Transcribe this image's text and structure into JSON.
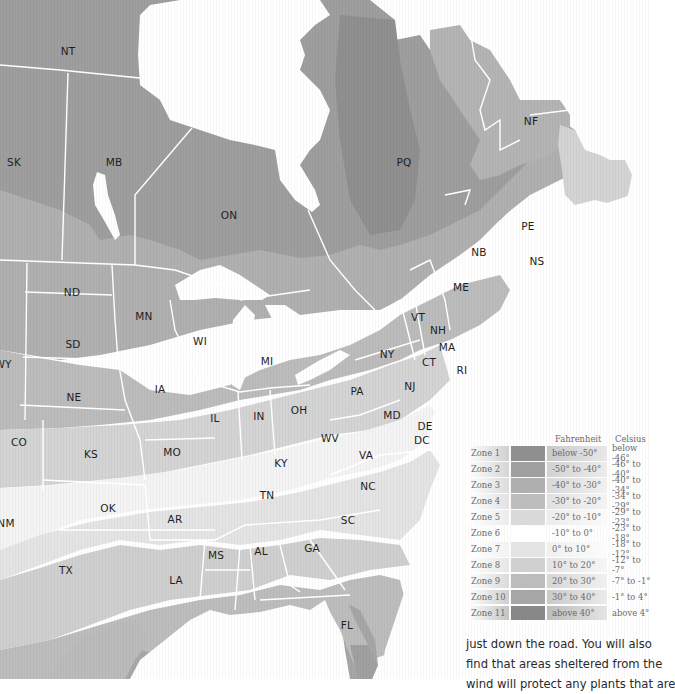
{
  "map": {
    "title": "Plant hardiness zones — North America (eastern)",
    "colors": {
      "zone1": "#8f8f8f",
      "zone2": "#a0a0a0",
      "zone3": "#afafaf",
      "zone4": "#bdbdbd",
      "zone5": "#d6d6d6",
      "zone6": "#f4f4f4",
      "zone7": "#e6e6e6",
      "zone8": "#d2d2d2",
      "zone9": "#c0c0c0",
      "zone10": "#adadad",
      "zone11": "#8c8c8c",
      "water": "#ffffff",
      "border": "#ffffff"
    },
    "labels": {
      "NT": "NT",
      "SK": "SK",
      "MB": "MB",
      "ON": "ON",
      "PQ": "PQ",
      "NF": "NF",
      "PE": "PE",
      "NB": "NB",
      "NS": "NS",
      "ME": "ME",
      "VT": "VT",
      "NH": "NH",
      "MA": "MA",
      "CT": "CT",
      "RI": "RI",
      "NY": "NY",
      "NJ": "NJ",
      "PA": "PA",
      "MD": "MD",
      "DE": "DE",
      "DC": "DC",
      "VA": "VA",
      "WV": "WV",
      "NC": "NC",
      "SC": "SC",
      "GA": "GA",
      "FL": "FL",
      "AL": "AL",
      "MS": "MS",
      "LA": "LA",
      "TN": "TN",
      "KY": "KY",
      "OH": "OH",
      "IN": "IN",
      "IL": "IL",
      "MI": "MI",
      "WI": "WI",
      "MN": "MN",
      "IA": "IA",
      "MO": "MO",
      "AR": "AR",
      "OK": "OK",
      "TX": "TX",
      "KS": "KS",
      "NE": "NE",
      "SD": "SD",
      "ND": "ND",
      "CO": "CO",
      "WY": "WY",
      "NM": "NM"
    }
  },
  "legend": {
    "header_fahrenheit": "Fahrenheit",
    "header_celsius": "Celsius",
    "zones": [
      {
        "zone": "Zone 1",
        "fahrenheit": "below -50°",
        "celsius": "below -46°",
        "color": "#8f8f8f"
      },
      {
        "zone": "Zone 2",
        "fahrenheit": "-50° to -40°",
        "celsius": "-46° to -40°",
        "color": "#a0a0a0"
      },
      {
        "zone": "Zone 3",
        "fahrenheit": "-40° to -30°",
        "celsius": "-40° to -34°",
        "color": "#afafaf"
      },
      {
        "zone": "Zone 4",
        "fahrenheit": "-30° to -20°",
        "celsius": "-34° to -29°",
        "color": "#bdbdbd"
      },
      {
        "zone": "Zone 5",
        "fahrenheit": "-20° to -10°",
        "celsius": "-29° to -23°",
        "color": "#dadada"
      },
      {
        "zone": "Zone 6",
        "fahrenheit": "-10° to 0°",
        "celsius": "-23° to -18°",
        "color": "#ffffff"
      },
      {
        "zone": "Zone 7",
        "fahrenheit": "0° to 10°",
        "celsius": "-18° to -12°",
        "color": "#e4e4e4"
      },
      {
        "zone": "Zone 8",
        "fahrenheit": "10° to 20°",
        "celsius": "-12° to -7°",
        "color": "#d0d0d0"
      },
      {
        "zone": "Zone 9",
        "fahrenheit": "20° to 30°",
        "celsius": "-7° to -1°",
        "color": "#bcbcbc"
      },
      {
        "zone": "Zone 10",
        "fahrenheit": "30° to 40°",
        "celsius": "-1° to 4°",
        "color": "#a6a6a6"
      },
      {
        "zone": "Zone 11",
        "fahrenheit": "above 40°",
        "celsius": "above 4°",
        "color": "#888888"
      }
    ]
  },
  "body_text": {
    "line1": "just down the road. You will also",
    "line2": "find that areas sheltered from the",
    "line3": "wind will protect any plants that are"
  }
}
